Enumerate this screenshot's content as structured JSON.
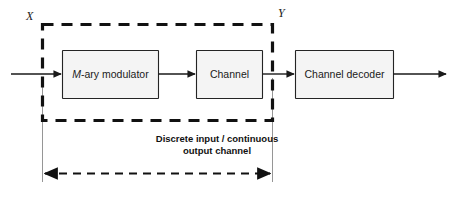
{
  "figure": {
    "type": "block-diagram",
    "background_color": "#ffffff",
    "line_color": "#1a1a1a",
    "box_fill_color": "#f4f4f4",
    "box_border_color": "#242424",
    "dashed_color": "#111111"
  },
  "blocks": [
    {
      "id": "modulator",
      "label_italic": "M",
      "label_rest": "-ary modulator"
    },
    {
      "id": "channel",
      "label": "Channel"
    },
    {
      "id": "decoder",
      "label": "Channel decoder"
    }
  ],
  "signal_labels": {
    "input": "X",
    "output": "Y"
  },
  "caption": {
    "line1": "Discrete input / continuous",
    "line2": "output channel"
  },
  "annotations": {
    "span_arrow_name": "discrete-input-continuous-output-channel-span"
  }
}
